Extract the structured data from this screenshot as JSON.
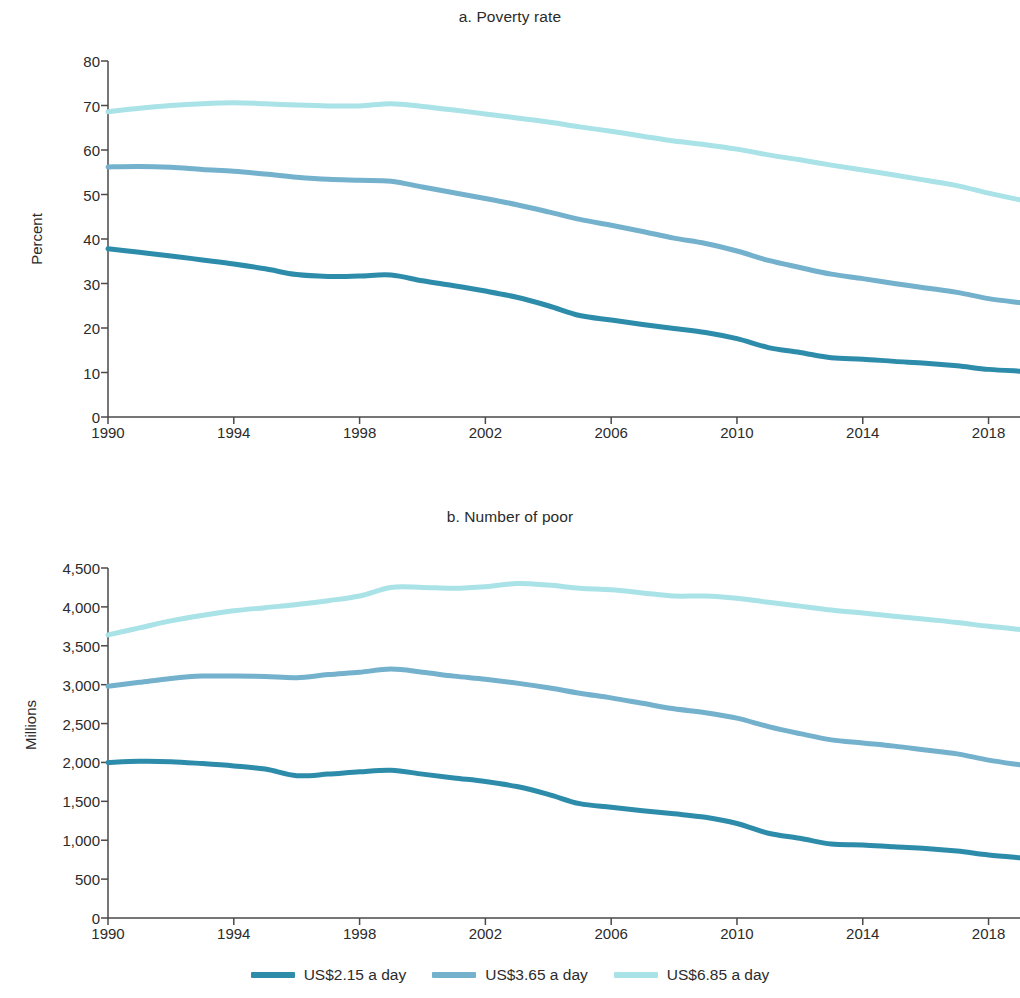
{
  "figure": {
    "background": "#ffffff",
    "panels": [
      {
        "key": "a",
        "title": "a. Poverty rate"
      },
      {
        "key": "b",
        "title": "b. Number of poor"
      }
    ]
  },
  "legend": {
    "position": "bottom-center",
    "items": [
      {
        "label": "US$2.15 a day",
        "color": "#2e8cab"
      },
      {
        "label": "US$3.65 a day",
        "color": "#74b1cd"
      },
      {
        "label": "US$6.85 a day",
        "color": "#a9e2e7"
      }
    ]
  },
  "chart_data": [
    {
      "type": "line",
      "id": "poverty-rate",
      "title": "a. Poverty rate",
      "xlabel": "",
      "ylabel": "Percent",
      "grid": false,
      "xlim": [
        1990,
        2019
      ],
      "ylim": [
        0,
        80
      ],
      "yticks": [
        0,
        10,
        20,
        30,
        40,
        50,
        60,
        70,
        80
      ],
      "ytick_labels": [
        "0",
        "10",
        "20",
        "30",
        "40",
        "50",
        "60",
        "70",
        "80"
      ],
      "xticks": [
        1990,
        1994,
        1998,
        2002,
        2006,
        2010,
        2014,
        2018
      ],
      "xtick_labels": [
        "1990",
        "1994",
        "1998",
        "2002",
        "2006",
        "2010",
        "2014",
        "2018"
      ],
      "x": [
        1990,
        1991,
        1992,
        1993,
        1994,
        1995,
        1996,
        1997,
        1998,
        1999,
        2000,
        2001,
        2002,
        2003,
        2004,
        2005,
        2006,
        2007,
        2008,
        2009,
        2010,
        2011,
        2012,
        2013,
        2014,
        2015,
        2016,
        2017,
        2018,
        2019
      ],
      "series": [
        {
          "name": "US$2.15 a day",
          "color": "#2e8cab",
          "values": [
            37.8,
            37.0,
            36.2,
            35.3,
            34.4,
            33.3,
            32.0,
            31.6,
            31.7,
            31.9,
            30.6,
            29.5,
            28.3,
            26.9,
            25.0,
            22.8,
            21.8,
            20.8,
            19.9,
            19.0,
            17.6,
            15.6,
            14.5,
            13.3,
            13.0,
            12.5,
            12.1,
            11.5,
            10.7,
            10.3
          ]
        },
        {
          "name": "US$3.65 a day",
          "color": "#74b1cd",
          "values": [
            56.2,
            56.3,
            56.1,
            55.6,
            55.2,
            54.6,
            53.9,
            53.4,
            53.2,
            53.0,
            51.7,
            50.4,
            49.1,
            47.7,
            46.1,
            44.4,
            43.1,
            41.7,
            40.2,
            39.0,
            37.3,
            35.2,
            33.6,
            32.1,
            31.1,
            30.0,
            29.0,
            28.0,
            26.6,
            25.7
          ]
        },
        {
          "name": "US$6.85 a day",
          "color": "#a9e2e7",
          "values": [
            68.6,
            69.4,
            70.0,
            70.4,
            70.6,
            70.4,
            70.1,
            69.9,
            69.9,
            70.4,
            69.8,
            69.0,
            68.1,
            67.2,
            66.3,
            65.2,
            64.2,
            63.1,
            62.0,
            61.2,
            60.2,
            58.9,
            57.8,
            56.6,
            55.5,
            54.4,
            53.2,
            52.0,
            50.3,
            48.8
          ]
        }
      ]
    },
    {
      "type": "line",
      "id": "number-of-poor",
      "title": "b. Number of poor",
      "xlabel": "",
      "ylabel": "Millions",
      "grid": false,
      "xlim": [
        1990,
        2019
      ],
      "ylim": [
        0,
        4500
      ],
      "yticks": [
        0,
        500,
        1000,
        1500,
        2000,
        2500,
        3000,
        3500,
        4000,
        4500
      ],
      "ytick_labels": [
        "0",
        "500",
        "1,000",
        "1,500",
        "2,000",
        "2,500",
        "3,000",
        "3,500",
        "4,000",
        "4,500"
      ],
      "xticks": [
        1990,
        1994,
        1998,
        2002,
        2006,
        2010,
        2014,
        2018
      ],
      "xtick_labels": [
        "1990",
        "1994",
        "1998",
        "2002",
        "2006",
        "2010",
        "2014",
        "2018"
      ],
      "x": [
        1990,
        1991,
        1992,
        1993,
        1994,
        1995,
        1996,
        1997,
        1998,
        1999,
        2000,
        2001,
        2002,
        2003,
        2004,
        2005,
        2006,
        2007,
        2008,
        2009,
        2010,
        2011,
        2012,
        2013,
        2014,
        2015,
        2016,
        2017,
        2018,
        2019
      ],
      "series": [
        {
          "name": "US$2.15 a day",
          "color": "#2e8cab",
          "values": [
            2000,
            2015,
            2010,
            1985,
            1955,
            1915,
            1830,
            1850,
            1880,
            1900,
            1850,
            1800,
            1755,
            1690,
            1590,
            1470,
            1425,
            1380,
            1340,
            1295,
            1215,
            1090,
            1025,
            950,
            940,
            915,
            895,
            860,
            810,
            775
          ]
        },
        {
          "name": "US$3.65 a day",
          "color": "#74b1cd",
          "values": [
            2980,
            3030,
            3080,
            3110,
            3110,
            3105,
            3090,
            3130,
            3160,
            3200,
            3160,
            3110,
            3070,
            3020,
            2960,
            2890,
            2830,
            2760,
            2690,
            2640,
            2570,
            2460,
            2370,
            2290,
            2250,
            2210,
            2160,
            2110,
            2030,
            1970
          ]
        },
        {
          "name": "US$6.85 a day",
          "color": "#a9e2e7",
          "values": [
            3640,
            3730,
            3820,
            3890,
            3950,
            3990,
            4030,
            4080,
            4140,
            4250,
            4250,
            4240,
            4260,
            4300,
            4280,
            4240,
            4220,
            4180,
            4140,
            4140,
            4110,
            4060,
            4010,
            3960,
            3920,
            3880,
            3840,
            3800,
            3750,
            3710
          ]
        }
      ]
    }
  ]
}
